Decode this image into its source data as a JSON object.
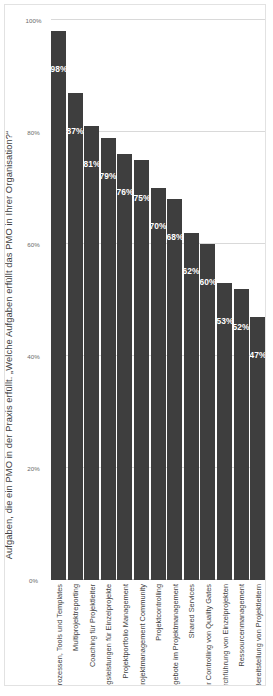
{
  "chart_data": {
    "type": "bar",
    "orientation": "horizontal",
    "title": "Aufgaben, die ein PMO in der Praxis erfüllt. „Welche Aufgaben erfüllt das PMO in Ihrer Organisation?“",
    "xlabel": "",
    "ylabel": "",
    "xlim": [
      0,
      100
    ],
    "grid": true,
    "legend": false,
    "unit": "%",
    "bar_color": "#3e3e3e",
    "gridline_color": "#d9d9d9",
    "value_label_color": "#ffffff",
    "tick_labels": [
      "0%",
      "20%",
      "40%",
      "60%",
      "80%",
      "100%"
    ],
    "ticks": [
      0,
      20,
      40,
      60,
      80,
      100
    ],
    "categories": [
      "Entwicklung von Methoden, Prozessen, Tools und Templates",
      "Multiprojektreporting",
      "Coaching für Projektleiter",
      "Bereitstellung von Unterstützungsleistungen für Einzelprojekte",
      "Projektportfolio Management",
      "Aufbau und Weiterentwicklung einer Projektmanagement Community",
      "Projektcontrolling",
      "Bildungsangebote im Projektmanagement",
      "Shared Services",
      "Qualitätsmanagement, z. B. über Controlling von Quality Gates",
      "Übernahme der Verantwortung für die Durchführung von Einzelprojekten",
      "Ressourcenmanagement",
      "Bereitstellung von Projektleitern"
    ],
    "values": [
      98,
      87,
      81,
      79,
      76,
      75,
      70,
      68,
      62,
      60,
      53,
      52,
      47
    ],
    "value_labels": [
      "98%",
      "87%",
      "81%",
      "79%",
      "76%",
      "75%",
      "70%",
      "68%",
      "62%",
      "60%",
      "53%",
      "52%",
      "47%"
    ]
  }
}
